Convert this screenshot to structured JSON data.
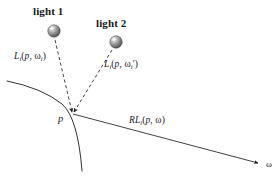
{
  "figure": {
    "background_color": "#ffffff",
    "ink_color": "#1a1a1a",
    "width": 278,
    "height": 178
  },
  "lights": [
    {
      "id": "light-1",
      "label": "light 1",
      "label_x": 33,
      "label_y": 6,
      "sphere_cx": 54,
      "sphere_cy": 31,
      "sphere_r": 6.2
    },
    {
      "id": "light-2",
      "label": "light 2",
      "label_x": 96,
      "label_y": 18,
      "sphere_cx": 116,
      "sphere_cy": 42,
      "sphere_r": 6.2
    }
  ],
  "surface_point": {
    "label": "p",
    "x": 72,
    "y": 113,
    "label_x": 58,
    "label_y": 114
  },
  "annotations": {
    "incident_1": {
      "prefix": "L",
      "subscript": "i",
      "args_open": "(",
      "arg_point": "p",
      "arg_sep": ", ",
      "arg_omega": "ω",
      "arg_omega_sub": "i",
      "arg_prime": "",
      "args_close": ")",
      "full": "Li(p, ωi)",
      "x": 14,
      "y": 52
    },
    "incident_2": {
      "prefix": "L",
      "subscript": "i",
      "args_open": "(",
      "arg_point": "p",
      "arg_sep": ", ",
      "arg_omega": "ω",
      "arg_omega_sub": "i",
      "arg_prime": "′",
      "args_close": ")",
      "full": "Li(p, ωi′)",
      "x": 104,
      "y": 60
    },
    "reflected": {
      "prefix": "RL",
      "subscript": "i",
      "args_open": "(",
      "arg_point": "p",
      "arg_sep": ", ",
      "arg_omega": "ω",
      "arg_omega_sub": "",
      "arg_prime": "",
      "args_close": ")",
      "full": "RLi(p, ω)",
      "x": 129,
      "y": 116
    },
    "omega_terminus": {
      "label": "ω",
      "x": 266,
      "y": 160
    }
  },
  "geometry": {
    "surface_curve": "M 7 81 Q 42 88 62 104 Q 78 118 82 171",
    "dashed_ray_1": "M 55 40 L 72 112",
    "dashed_ray_2": "M 112 50 L 74 112",
    "exit_ray": "M 73 114 L 258 163",
    "dash_pattern": "3.2 2.6",
    "stroke_width": 0.9
  }
}
